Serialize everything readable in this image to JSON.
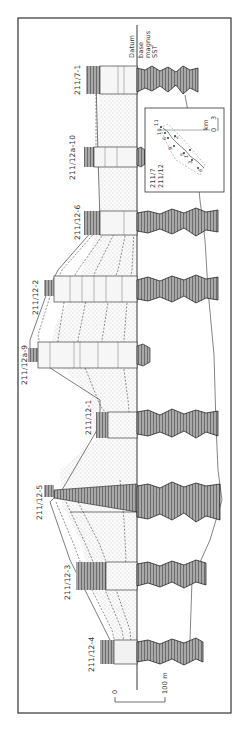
{
  "figure": {
    "orientation": "rotated 90 degrees counter-clockwise",
    "datum_label": [
      "Datum",
      "base",
      "magnus",
      "SST"
    ],
    "scale_bar": {
      "start_label": "0",
      "end_label": "100 m"
    },
    "colors": {
      "ink": "#1a1a1a",
      "log_fill": "#8c8c8c",
      "sand_stipple": "#d9d9d9",
      "frame": "#333333"
    }
  },
  "wells": [
    {
      "id": "211/7-1",
      "label": "211/7-1"
    },
    {
      "id": "211/12a-10",
      "label": "211/12a-10"
    },
    {
      "id": "211/12-6",
      "label": "211/12-6"
    },
    {
      "id": "211/12-2",
      "label": "211/12-2"
    },
    {
      "id": "211/12a-9",
      "label": "211/12a-9"
    },
    {
      "id": "211/12-1",
      "label": "211/12-1"
    },
    {
      "id": "211/12-5",
      "label": "211/12-5"
    },
    {
      "id": "211/12-3",
      "label": "211/12-3"
    },
    {
      "id": "211/12-4",
      "label": "211/12-4"
    }
  ],
  "inset_map": {
    "block_labels": [
      "211/7",
      "211/12"
    ],
    "well_numbers": [
      "11",
      "10",
      "6",
      "2",
      "9",
      "1",
      "5",
      "3",
      "4"
    ],
    "scale": {
      "unit": "km",
      "start": "0",
      "end": "3"
    }
  }
}
